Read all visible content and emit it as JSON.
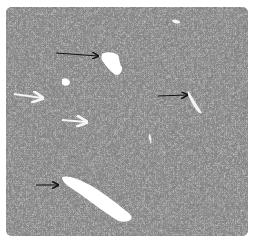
{
  "image": {
    "type": "histology-micrograph",
    "color_mode": "grayscale",
    "stain_appearance": "H&E (grayscale)",
    "colors": {
      "background": "#ffffff",
      "tissue_base": "#8d8d8d",
      "nuclei": "#2e2e2e",
      "vessel_lumen": "#ffffff"
    }
  },
  "annotations": {
    "arrows": [
      {
        "id": "arrow-1",
        "style": "black",
        "direction": "right",
        "target": "vessel-upper-center",
        "x1": 50,
        "y1": 46,
        "x2": 92,
        "y2": 49
      },
      {
        "id": "arrow-2",
        "style": "white-outline",
        "direction": "right",
        "target": "tissue-left",
        "x1": 8,
        "y1": 87,
        "x2": 36,
        "y2": 91
      },
      {
        "id": "arrow-3",
        "style": "white-outline",
        "direction": "right",
        "target": "tissue-center-left",
        "x1": 56,
        "y1": 113,
        "x2": 80,
        "y2": 115
      },
      {
        "id": "arrow-4",
        "style": "black",
        "direction": "right",
        "target": "vessel-right",
        "x1": 152,
        "y1": 89,
        "x2": 181,
        "y2": 88
      },
      {
        "id": "arrow-5",
        "style": "black",
        "direction": "right",
        "target": "vessel-lower-large",
        "x1": 30,
        "y1": 178,
        "x2": 52,
        "y2": 178
      }
    ]
  },
  "vessels": [
    {
      "id": "vessel-upper-center",
      "shape": "irregular"
    },
    {
      "id": "vessel-small-left",
      "shape": "small-oval"
    },
    {
      "id": "vessel-right",
      "shape": "elongated-diagonal"
    },
    {
      "id": "vessel-lower-large",
      "shape": "elongated-diagonal"
    },
    {
      "id": "vessel-top-right",
      "shape": "small-slit"
    }
  ]
}
